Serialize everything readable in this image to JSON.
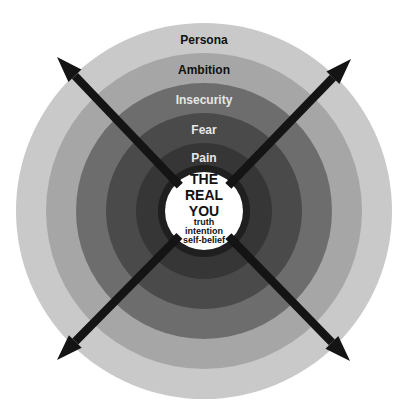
{
  "diagram": {
    "center": {
      "x": 204,
      "y": 211
    },
    "rings": [
      {
        "label": "Persona",
        "radius": 188,
        "fill": "#c9c9c9",
        "text_color": "#111111",
        "label_y": 40
      },
      {
        "label": "Ambition",
        "radius": 158,
        "fill": "#a6a6a6",
        "text_color": "#111111",
        "label_y": 70
      },
      {
        "label": "Insecurity",
        "radius": 128,
        "fill": "#6d6d6d",
        "text_color": "#e6e6e6",
        "label_y": 100
      },
      {
        "label": "Fear",
        "radius": 98,
        "fill": "#4a4a4a",
        "text_color": "#e6e6e6",
        "label_y": 130
      },
      {
        "label": "Pain",
        "radius": 68,
        "fill": "#363636",
        "text_color": "#e6e6e6",
        "label_y": 158
      },
      {
        "label": "",
        "radius": 46,
        "fill": "#1f1f1f",
        "text_color": "#e6e6e6",
        "label_y": 0
      }
    ],
    "core": {
      "radius": 39,
      "fill": "#ffffff",
      "title_lines": [
        "THE",
        "REAL",
        "YOU"
      ],
      "sub_lines": [
        "truth",
        "intention",
        "self-belief"
      ]
    },
    "arrows": [
      {
        "name": "arrow-top-left",
        "tip": [
          57,
          57
        ]
      },
      {
        "name": "arrow-top-right",
        "tip": [
          351,
          59
        ]
      },
      {
        "name": "arrow-bottom-left",
        "tip": [
          57,
          360
        ]
      },
      {
        "name": "arrow-bottom-right",
        "tip": [
          350,
          361
        ]
      }
    ],
    "arrow_color": "#141414"
  }
}
